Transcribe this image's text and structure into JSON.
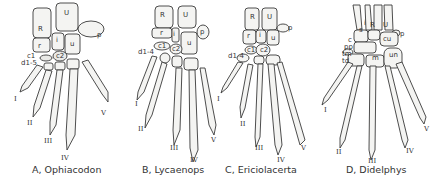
{
  "figure": {
    "panels": [
      {
        "id": "A",
        "caption": "A, Ophiacodon",
        "bone_labels": {
          "R": "R",
          "U": "U",
          "p": "p",
          "r": "r",
          "i": "i",
          "u": "u",
          "c1": "c1",
          "c2": "c2",
          "d1_5": "d1-5"
        },
        "digits": [
          "I",
          "II",
          "III",
          "IV",
          "V"
        ]
      },
      {
        "id": "B",
        "caption": "B, Lycaenops",
        "bone_labels": {
          "R": "R",
          "U": "U",
          "p": "p",
          "r": "r",
          "i": "i",
          "u": "u",
          "c1": "c1",
          "c2": "c2",
          "d1_4": "d1-4"
        },
        "digits": [
          "I",
          "II",
          "III",
          "IV",
          "V"
        ]
      },
      {
        "id": "C",
        "caption": "C, Ericiolacerta",
        "bone_labels": {
          "R": "R",
          "U": "U",
          "p": "p",
          "r": "r",
          "i": "i",
          "u": "u",
          "c1": "c1",
          "c2": "c2",
          "d1_4": "d1-4"
        },
        "digits": [
          "I",
          "II",
          "III",
          "IV",
          "V"
        ]
      },
      {
        "id": "D",
        "caption": "D, Didelphys",
        "bone_labels": {
          "R": "R",
          "U": "U",
          "p": "p",
          "i": "i",
          "s": "s",
          "cu": "cu",
          "c": "c",
          "pp": "pp",
          "tm": "tm",
          "td": "td",
          "m": "m",
          "un": "un"
        },
        "digits": [
          "I",
          "II",
          "III",
          "IV",
          "V"
        ]
      }
    ]
  }
}
